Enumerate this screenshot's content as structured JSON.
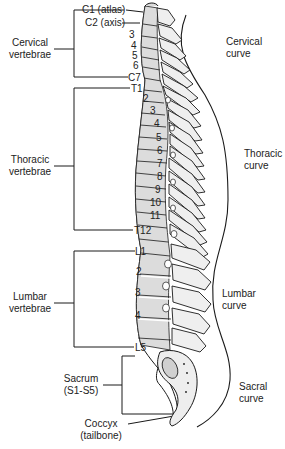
{
  "groups": {
    "cervical": {
      "line1": "Cervical",
      "line2": "vertebrae"
    },
    "thoracic": {
      "line1": "Thoracic",
      "line2": "vertebrae"
    },
    "lumbar": {
      "line1": "Lumbar",
      "line2": "vertebrae"
    },
    "sacrum": {
      "line1": "Sacrum",
      "line2": "(S1-S5)"
    },
    "coccyx": {
      "line1": "Coccyx",
      "line2": "(tailbone)"
    }
  },
  "vertebra_labels": {
    "c1": "C1 (atlas)",
    "c2": "C2 (axis)",
    "c3": "3",
    "c4": "4",
    "c5": "5",
    "c6": "6",
    "c7": "C7",
    "t1": "T1",
    "t2": "2",
    "t3": "3",
    "t4": "4",
    "t5": "5",
    "t6": "6",
    "t7": "7",
    "t8": "8",
    "t9": "9",
    "t10": "10",
    "t11": "11",
    "t12": "T12",
    "l1": "L1",
    "l2": "2",
    "l3": "3",
    "l4": "4",
    "l5": "L5"
  },
  "curves": {
    "cervical": {
      "line1": "Cervical",
      "line2": "curve"
    },
    "thoracic": {
      "line1": "Thoracic",
      "line2": "curve"
    },
    "lumbar": {
      "line1": "Lumbar",
      "line2": "curve"
    },
    "sacral": {
      "line1": "Sacral",
      "line2": "curve"
    }
  },
  "colors": {
    "bone_fill": "#d9d9d9",
    "bone_light": "#eeeeee",
    "outline": "#1a1a1a",
    "background": "#ffffff"
  }
}
